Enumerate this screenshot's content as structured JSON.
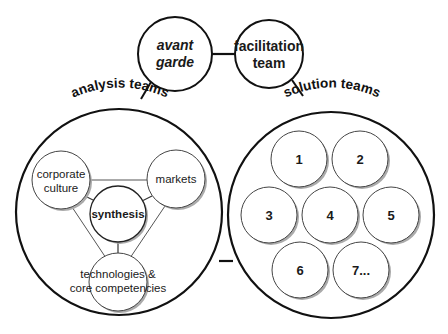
{
  "top_nodes": {
    "avant_garde": {
      "line1": "avant",
      "line2": "garde",
      "style": "bold-italic"
    },
    "facilitation": {
      "line1": "facilitation",
      "line2": "team",
      "style": "bold"
    }
  },
  "groups": {
    "analysis": {
      "label": "analysis teams",
      "nodes": {
        "corporate_culture": {
          "line1": "corporate",
          "line2": "culture"
        },
        "markets": {
          "line1": "markets"
        },
        "synthesis": {
          "line1": "synthesis"
        },
        "technologies": {
          "line1": "technologies &",
          "line2": "core competencies"
        }
      }
    },
    "solution": {
      "label": "solution teams",
      "teams": [
        "1",
        "2",
        "3",
        "4",
        "5",
        "6",
        "7..."
      ]
    }
  },
  "colors": {
    "stroke": "#111111",
    "thin_stroke": "#555555",
    "shadow": "#9a9a9a",
    "background": "#ffffff"
  }
}
